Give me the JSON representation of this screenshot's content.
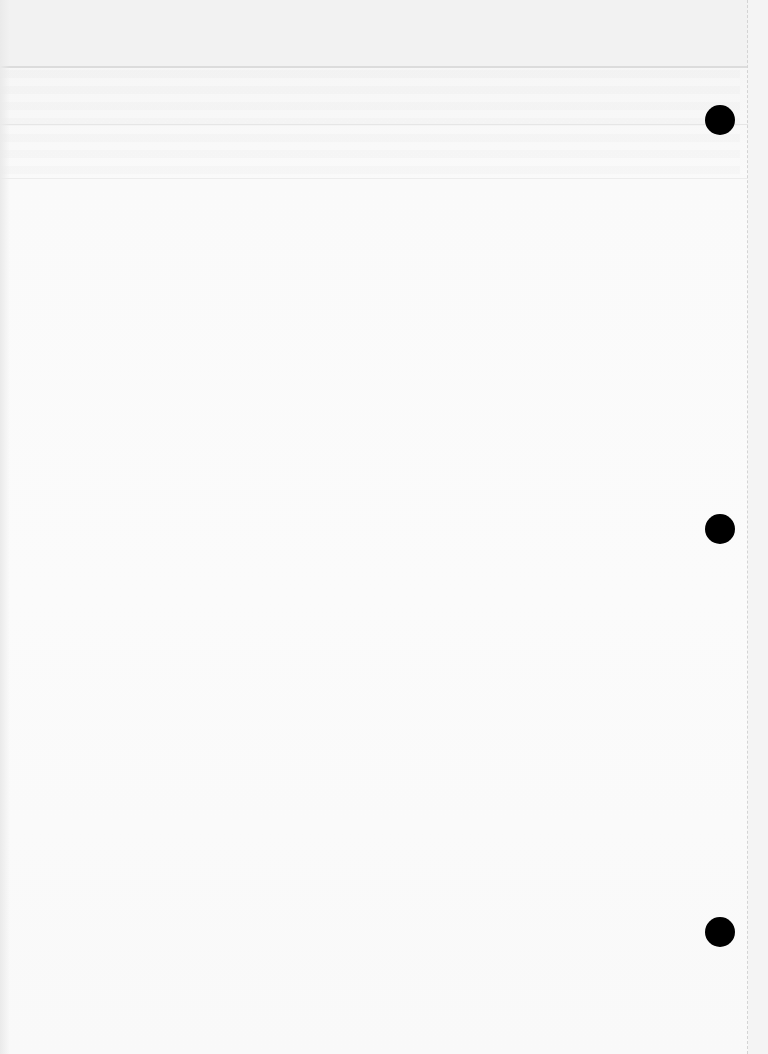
{
  "document": {
    "type": "blank scanned page",
    "content_text": "",
    "punch_holes": [
      {
        "position": "top",
        "color": "#000000"
      },
      {
        "position": "middle",
        "color": "#000000"
      },
      {
        "position": "bottom",
        "color": "#000000"
      }
    ],
    "colors": {
      "paper": "#fafafa",
      "header_band": "#f2f2f2",
      "rule": "#dcdcdc",
      "hole": "#000000"
    }
  }
}
